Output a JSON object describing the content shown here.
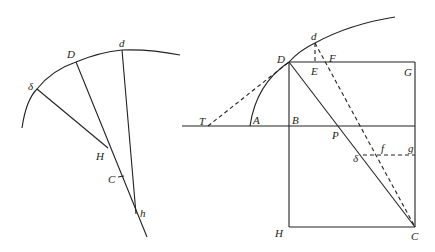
{
  "figure": {
    "stroke_color": "#222222",
    "background": "#ffffff"
  },
  "left_figure": {
    "labels": {
      "delta": "δ",
      "D": "D",
      "d": "d",
      "H": "H",
      "C": "C",
      "h": "h"
    },
    "points": {
      "delta": [
        37,
        89
      ],
      "D": [
        76,
        62
      ],
      "d": [
        122,
        50
      ],
      "H": [
        108,
        148
      ],
      "C": [
        121,
        178
      ],
      "h": [
        137,
        213
      ]
    }
  },
  "right_figure": {
    "labels": {
      "d": "d",
      "D": "D",
      "E": "E",
      "F": "F",
      "G": "G",
      "T": "T",
      "A": "A",
      "B": "B",
      "P": "P",
      "delta": "δ",
      "f": "f",
      "g": "g",
      "H": "H",
      "C": "C"
    },
    "points": {
      "d": [
        315,
        43
      ],
      "D": [
        289,
        62
      ],
      "E": [
        315,
        62
      ],
      "F": [
        327,
        62
      ],
      "G": [
        415,
        62
      ],
      "T": [
        208,
        126
      ],
      "A": [
        250,
        126
      ],
      "B": [
        289,
        126
      ],
      "P": [
        342,
        126
      ],
      "delta": [
        363,
        155
      ],
      "f": [
        378,
        155
      ],
      "g": [
        415,
        155
      ],
      "H": [
        289,
        227
      ],
      "C": [
        415,
        227
      ]
    }
  }
}
